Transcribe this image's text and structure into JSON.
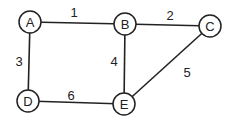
{
  "graph": {
    "nodes": [
      {
        "id": "A",
        "label": "A",
        "x": 30,
        "y": 22
      },
      {
        "id": "B",
        "label": "B",
        "x": 125,
        "y": 24
      },
      {
        "id": "C",
        "label": "C",
        "x": 210,
        "y": 26
      },
      {
        "id": "D",
        "label": "D",
        "x": 28,
        "y": 101
      },
      {
        "id": "E",
        "label": "E",
        "x": 124,
        "y": 104
      }
    ],
    "edges": [
      {
        "from": "A",
        "to": "B",
        "weight": "1",
        "lx": 74,
        "ly": 12
      },
      {
        "from": "B",
        "to": "C",
        "weight": "2",
        "lx": 170,
        "ly": 15
      },
      {
        "from": "A",
        "to": "D",
        "weight": "3",
        "lx": 19,
        "ly": 61
      },
      {
        "from": "B",
        "to": "E",
        "weight": "4",
        "lx": 114,
        "ly": 61
      },
      {
        "from": "C",
        "to": "E",
        "weight": "5",
        "lx": 187,
        "ly": 72
      },
      {
        "from": "D",
        "to": "E",
        "weight": "6",
        "lx": 71,
        "ly": 95
      }
    ]
  }
}
